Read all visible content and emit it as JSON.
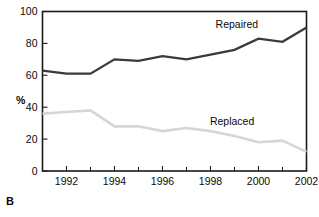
{
  "panel": {
    "label": "B"
  },
  "chart_data": {
    "type": "line",
    "title": "",
    "subtitle": "",
    "xlabel": "",
    "ylabel": "%",
    "xlim": [
      1991,
      2002
    ],
    "ylim": [
      0,
      100
    ],
    "grid": false,
    "legend_position": "inline-right",
    "x": [
      1991,
      1992,
      1993,
      1994,
      1995,
      1996,
      1997,
      1998,
      1999,
      2000,
      2001,
      2002
    ],
    "xticks_major": [
      1992,
      1994,
      1996,
      1998,
      2000,
      2002
    ],
    "xtick_labels": [
      "1992",
      "1994",
      "1996",
      "1998",
      "2000",
      "2002"
    ],
    "xticks_minor": [
      1991,
      1993,
      1995,
      1997,
      1999,
      2001
    ],
    "yticks": [
      0,
      20,
      40,
      60,
      80,
      100
    ],
    "ytick_labels": [
      "0",
      "20",
      "40",
      "60",
      "80",
      "100"
    ],
    "series": [
      {
        "name": "Repaired",
        "color": "#3a3a3a",
        "label_x": 1999.1,
        "label_y": 92,
        "values": [
          63,
          61,
          61,
          70,
          69,
          72,
          70,
          73,
          76,
          83,
          81,
          90
        ]
      },
      {
        "name": "Replaced",
        "color": "#d6d6d6",
        "label_x": 1998.9,
        "label_y": 31,
        "values": [
          36,
          37,
          38,
          28,
          28,
          25,
          27,
          25,
          22,
          18,
          19,
          12
        ]
      }
    ],
    "annotations": [
      {
        "text": "Repaired",
        "series": "Repaired"
      },
      {
        "text": "Replaced",
        "series": "Replaced"
      }
    ]
  },
  "axis": {
    "y_title": "%"
  }
}
